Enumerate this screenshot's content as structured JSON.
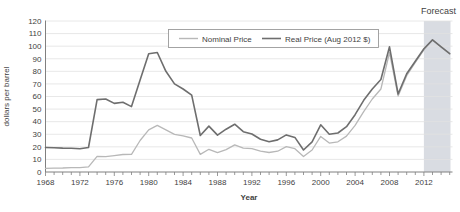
{
  "chart": {
    "forecast_label": "Forecast",
    "colors": {
      "background": "#ffffff",
      "grid": "#e2e2e2",
      "axis": "#808080",
      "tick_text": "#3f3f3f",
      "forecast_band": "#ccd0d8",
      "legend_border": "#9a9a9a",
      "legend_bg": "#ffffff"
    }
  },
  "chart_data": {
    "type": "line",
    "title": "",
    "xlabel": "Year",
    "ylabel": "dollars per barrel",
    "ylim": [
      0,
      120
    ],
    "ytick_step": 10,
    "xtick_labels": [
      1968,
      1972,
      1976,
      1980,
      1984,
      1988,
      1992,
      1996,
      2000,
      2004,
      2008,
      2012
    ],
    "grid": "horizontal",
    "legend_position": "top-center",
    "forecast_annotation": "Forecast",
    "forecast_start_year": 2012,
    "x": [
      1968,
      1969,
      1970,
      1971,
      1972,
      1973,
      1974,
      1975,
      1976,
      1977,
      1978,
      1979,
      1980,
      1981,
      1982,
      1983,
      1984,
      1985,
      1986,
      1987,
      1988,
      1989,
      1990,
      1991,
      1992,
      1993,
      1994,
      1995,
      1996,
      1997,
      1998,
      1999,
      2000,
      2001,
      2002,
      2003,
      2004,
      2005,
      2006,
      2007,
      2008,
      2009,
      2010,
      2011,
      2012,
      2013,
      2014,
      2015
    ],
    "series": [
      {
        "name": "Nominal Price",
        "color": "#b8b8b8",
        "stroke_width": 1.3,
        "values": [
          2.9,
          3.1,
          3.2,
          3.4,
          3.4,
          4.1,
          12.5,
          12.2,
          13,
          13.9,
          14,
          25,
          33.5,
          37,
          33.5,
          30,
          28.8,
          27,
          14,
          18,
          15.3,
          17.8,
          21.5,
          19,
          18.5,
          16.5,
          15.5,
          16.5,
          20.2,
          18.5,
          12.3,
          17.5,
          28.3,
          23,
          24,
          28.5,
          37,
          48,
          58,
          66,
          95,
          60.5,
          76.5,
          87,
          97,
          105,
          99.5,
          94
        ]
      },
      {
        "name": "Real Price (Aug 2012 $)",
        "color": "#6e6e6e",
        "stroke_width": 1.6,
        "values": [
          19.5,
          19.3,
          19,
          18.8,
          18.5,
          19.5,
          57.5,
          58,
          54.5,
          55.5,
          52,
          73,
          94,
          95,
          80,
          70,
          66,
          61,
          29,
          36.5,
          29.3,
          34,
          38,
          32,
          30.2,
          26,
          24,
          25.5,
          29.5,
          27.5,
          17.5,
          24,
          37.5,
          30,
          31,
          36,
          45.5,
          57,
          66,
          73.5,
          99.5,
          62,
          78,
          88,
          98,
          105,
          99.5,
          94
        ]
      }
    ]
  }
}
